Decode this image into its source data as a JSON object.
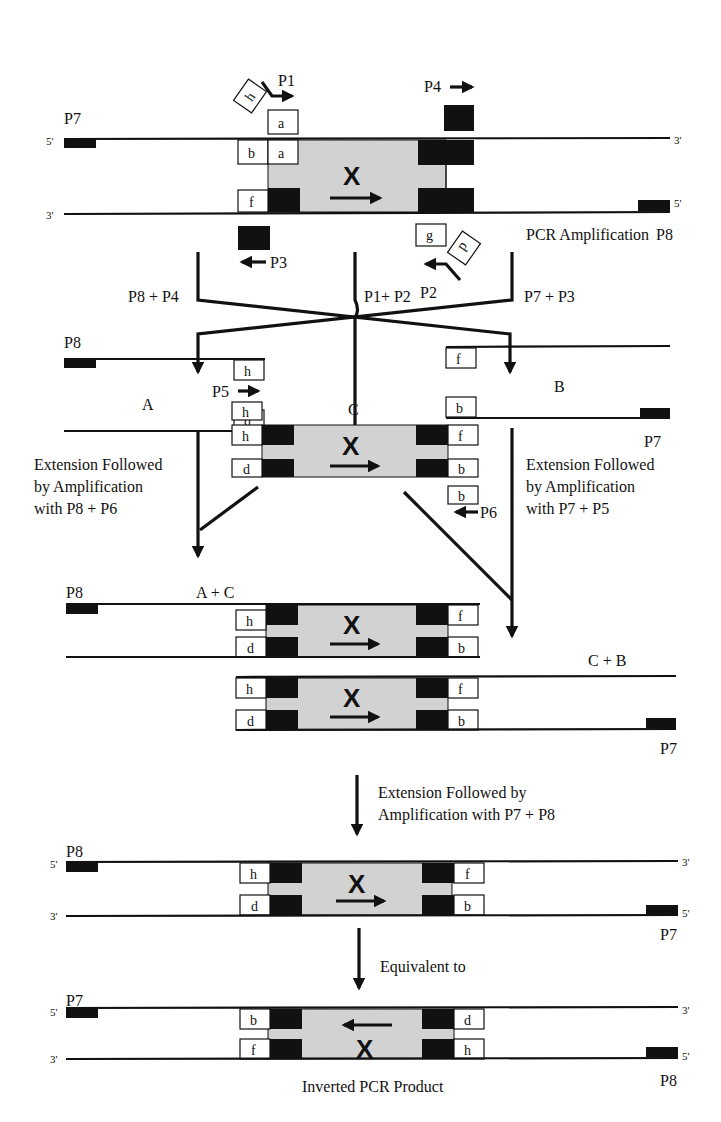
{
  "diagram": {
    "type": "inverted-pcr-schematic",
    "gray_fill": "#d2d2d2",
    "black_fill": "#111111",
    "strand_labels": {
      "five_prime": "5'",
      "three_prime": "3'"
    },
    "insert_label": "X",
    "top": {
      "primers": {
        "p1": "P1",
        "p2": "P2",
        "p3": "P3",
        "p4": "P4",
        "p7": "P7",
        "p8": "P8"
      },
      "boxes": {
        "h": "h",
        "a": "a",
        "b": "b",
        "a2": "a",
        "f": "f",
        "g": "g",
        "d": "d"
      }
    },
    "step1": {
      "label": "PCR Amplification",
      "left": "P8 + P4",
      "middle": "P1+ P2",
      "right": "P7 + P3"
    },
    "product_a": {
      "label": "A",
      "primer": "P8",
      "boxes": [
        "h",
        "d"
      ]
    },
    "product_b": {
      "label": "B",
      "primer": "P7",
      "boxes": [
        "f",
        "b"
      ]
    },
    "product_c": {
      "label": "C",
      "primer_p5": "P5",
      "primer_p6": "P6",
      "boxes": {
        "h_top": "h",
        "h": "h",
        "d": "d",
        "f": "f",
        "b": "b",
        "b_bottom": "b"
      }
    },
    "step2_left": {
      "line1": "Extension Followed",
      "line2": "by Amplification",
      "line3": "with P8 + P6"
    },
    "step2_right": {
      "line1": "Extension Followed",
      "line2": "by Amplification",
      "line3": "with P7 + P5"
    },
    "product_ac": {
      "label": "A + C",
      "primer": "P8",
      "boxes": [
        "h",
        "d",
        "f",
        "b"
      ]
    },
    "product_cb": {
      "label": "C + B",
      "primer": "P7",
      "boxes": [
        "h",
        "d",
        "f",
        "b"
      ]
    },
    "step3": {
      "line1": "Extension Followed by",
      "line2": "Amplification with P7 + P8"
    },
    "product_final": {
      "primer_left": "P8",
      "primer_right": "P7",
      "boxes": [
        "h",
        "d",
        "f",
        "b"
      ]
    },
    "step4": {
      "label": "Equivalent to"
    },
    "product_inverted": {
      "primer_left": "P7",
      "primer_right": "P8",
      "boxes": [
        "b",
        "f",
        "d",
        "h"
      ],
      "caption": "Inverted PCR Product"
    }
  }
}
